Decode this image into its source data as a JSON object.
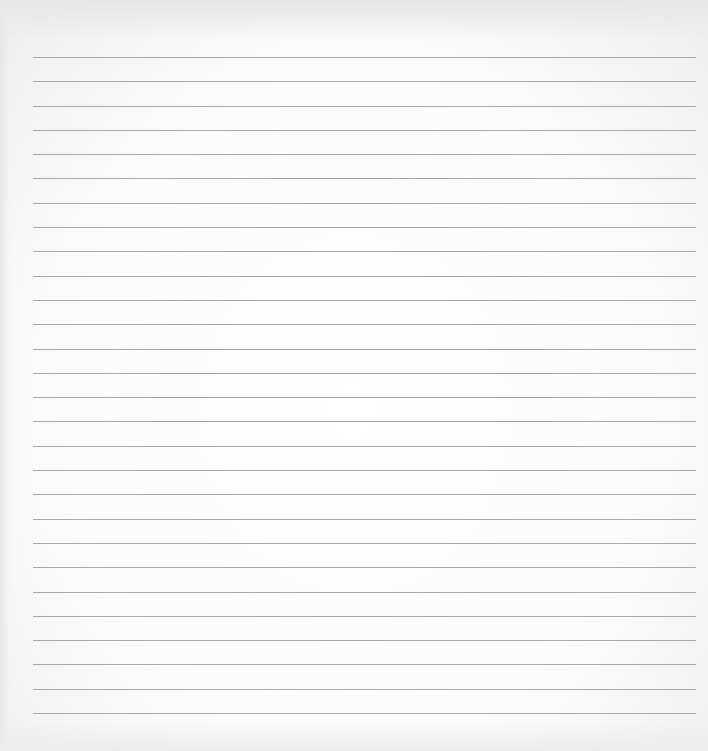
{
  "sheet": {
    "description": "Blank ruled paper",
    "rule_count": 28,
    "rule_color": "#a8a8a8",
    "paper_color": "#fbfbfb",
    "written_text": ""
  }
}
